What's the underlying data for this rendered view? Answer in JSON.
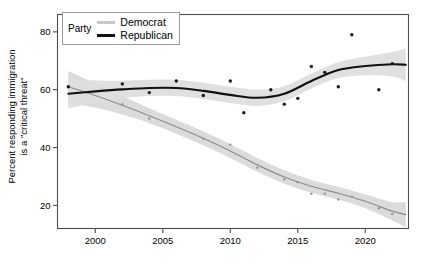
{
  "chart_data": {
    "type": "line",
    "title": "",
    "subtitle": "",
    "xlabel": "",
    "ylabel": "Percent responding immigration is a \"critical threat\"",
    "ylabel_line1": "Percent responding immigration",
    "ylabel_line2": "is a \"critical threat\"",
    "xlim": [
      1997.2,
      2023.2
    ],
    "ylim": [
      12,
      86
    ],
    "xticks": [
      2000,
      2005,
      2010,
      2015,
      2020
    ],
    "xtick_labels": [
      "2000",
      "2005",
      "2010",
      "2015",
      "2020"
    ],
    "yticks": [
      20,
      40,
      60,
      80
    ],
    "ytick_labels": [
      "20",
      "40",
      "60",
      "80"
    ],
    "grid": false,
    "legend_position": "top-left-inside",
    "legend_title": "Party",
    "smoothing": "loess with 95% confidence ribbon",
    "series": [
      {
        "name": "Democrat",
        "color": "#c9c9c9",
        "ribbon_color": "#d9d9d9",
        "line_color": "#8d8d8d",
        "point_color": "#9a9a9a",
        "points": [
          {
            "x": 1998,
            "y": 61
          },
          {
            "x": 2002,
            "y": 55
          },
          {
            "x": 2004,
            "y": 50
          },
          {
            "x": 2008,
            "y": 43
          },
          {
            "x": 2010,
            "y": 41
          },
          {
            "x": 2012,
            "y": 33
          },
          {
            "x": 2014,
            "y": 29
          },
          {
            "x": 2015,
            "y": 28
          },
          {
            "x": 2016,
            "y": 24
          },
          {
            "x": 2017,
            "y": 24
          },
          {
            "x": 2018,
            "y": 22
          },
          {
            "x": 2019,
            "y": 23
          },
          {
            "x": 2021,
            "y": 19
          },
          {
            "x": 2022,
            "y": 17
          }
        ],
        "fit": [
          {
            "x": 1998,
            "y": 61.0
          },
          {
            "x": 2000,
            "y": 58.0
          },
          {
            "x": 2002,
            "y": 54.6
          },
          {
            "x": 2004,
            "y": 51.0
          },
          {
            "x": 2006,
            "y": 47.2
          },
          {
            "x": 2008,
            "y": 43.2
          },
          {
            "x": 2010,
            "y": 38.8
          },
          {
            "x": 2012,
            "y": 34.0
          },
          {
            "x": 2014,
            "y": 29.8
          },
          {
            "x": 2016,
            "y": 26.6
          },
          {
            "x": 2018,
            "y": 24.2
          },
          {
            "x": 2020,
            "y": 21.4
          },
          {
            "x": 2022,
            "y": 18.0
          },
          {
            "x": 2023,
            "y": 16.8
          }
        ],
        "ribbon_half_width": [
          5.5,
          4.2,
          3.2,
          2.6,
          2.4,
          2.4,
          2.4,
          2.4,
          2.3,
          2.2,
          2.2,
          2.4,
          3.2,
          4.4
        ]
      },
      {
        "name": "Republican",
        "color": "#000000",
        "ribbon_color": "#dedede",
        "line_color": "#111111",
        "point_color": "#1a1a1a",
        "points": [
          {
            "x": 1998,
            "y": 61
          },
          {
            "x": 2002,
            "y": 62
          },
          {
            "x": 2004,
            "y": 59
          },
          {
            "x": 2006,
            "y": 63
          },
          {
            "x": 2008,
            "y": 58
          },
          {
            "x": 2010,
            "y": 63
          },
          {
            "x": 2011,
            "y": 52
          },
          {
            "x": 2013,
            "y": 60
          },
          {
            "x": 2014,
            "y": 55
          },
          {
            "x": 2015,
            "y": 57
          },
          {
            "x": 2016,
            "y": 68
          },
          {
            "x": 2017,
            "y": 66
          },
          {
            "x": 2018,
            "y": 61
          },
          {
            "x": 2019,
            "y": 79
          },
          {
            "x": 2021,
            "y": 60
          },
          {
            "x": 2022,
            "y": 69
          }
        ],
        "fit": [
          {
            "x": 1998,
            "y": 58.6
          },
          {
            "x": 2000,
            "y": 59.4
          },
          {
            "x": 2002,
            "y": 60.1
          },
          {
            "x": 2004,
            "y": 60.6
          },
          {
            "x": 2006,
            "y": 60.6
          },
          {
            "x": 2008,
            "y": 59.6
          },
          {
            "x": 2010,
            "y": 58.2
          },
          {
            "x": 2012,
            "y": 57.2
          },
          {
            "x": 2014,
            "y": 58.6
          },
          {
            "x": 2016,
            "y": 63.0
          },
          {
            "x": 2018,
            "y": 66.8
          },
          {
            "x": 2020,
            "y": 68.2
          },
          {
            "x": 2022,
            "y": 68.8
          },
          {
            "x": 2023,
            "y": 68.6
          }
        ],
        "ribbon_half_width": [
          5.0,
          3.8,
          3.0,
          2.8,
          2.8,
          2.8,
          2.8,
          2.8,
          2.6,
          2.6,
          2.8,
          3.2,
          4.2,
          5.6
        ]
      }
    ]
  },
  "legend": {
    "title": "Party",
    "entries": [
      {
        "label": "Democrat",
        "swatch": "light-gray-line"
      },
      {
        "label": "Republican",
        "swatch": "black-line"
      }
    ]
  },
  "colors": {
    "democrat_line": "#8d8d8d",
    "democrat_swatch": "#c9c9c9",
    "republican_line": "#111111",
    "ribbon": "#dcdcdc",
    "axis": "#4d4d4d",
    "text": "#000000"
  }
}
